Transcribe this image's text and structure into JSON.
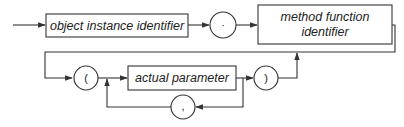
{
  "diagram": {
    "type": "syntax-railroad-diagram",
    "nodes": {
      "object_instance_identifier": "object instance identifier",
      "dot": "·",
      "method_function_identifier_line1": "method function",
      "method_function_identifier_line2": "identifier",
      "open_paren": "(",
      "actual_parameter": "actual parameter",
      "close_paren": ")",
      "comma": ","
    },
    "sequence": [
      "object instance identifier",
      ".",
      "method function identifier",
      "(",
      "actual parameter",
      ")"
    ],
    "loops": [
      {
        "repeat": "actual parameter",
        "separator": ","
      }
    ],
    "optional": [
      "( actual parameter { , actual parameter } )"
    ],
    "colors": {
      "line": "#333333",
      "background": "#ffffff",
      "text": "#222222"
    }
  }
}
